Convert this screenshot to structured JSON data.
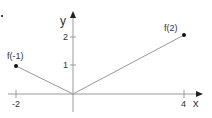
{
  "diagram": {
    "axes": {
      "x_label": "x",
      "y_label": "y",
      "x_ticks": [
        {
          "value": -2,
          "label": "-2"
        },
        {
          "value": 4,
          "label": "4"
        }
      ],
      "y_ticks": [
        {
          "value": 1,
          "label": "1"
        },
        {
          "value": 2,
          "label": "2"
        }
      ]
    },
    "points": [
      {
        "name": "f(-1)",
        "label": "f(-1)",
        "x": -2,
        "y": 1
      },
      {
        "name": "f(2)",
        "label": "f(2)",
        "x": 4,
        "y": 2
      }
    ],
    "segments": [
      {
        "from": [
          -2,
          1
        ],
        "to": [
          0,
          0
        ]
      },
      {
        "from": [
          0,
          0
        ],
        "to": [
          4,
          2
        ]
      }
    ],
    "colors": {
      "axis": "#888888",
      "line": "#888888",
      "point": "#111111",
      "text": "#333333"
    }
  }
}
